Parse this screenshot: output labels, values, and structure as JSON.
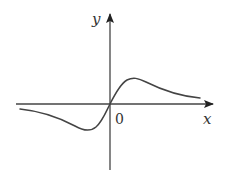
{
  "figure": {
    "type": "function-graph",
    "axes": {
      "x_label": "x",
      "y_label": "y",
      "origin_label": "0"
    },
    "colors": {
      "axis": "#444444",
      "curve": "#444444",
      "text": "#333333",
      "background": "#ffffff"
    },
    "curve_shape": {
      "local_max": "positive x, above axis",
      "local_min": "negative x, below axis",
      "passes_through_origin": true,
      "tends_to_zero_both_sides": true
    }
  }
}
